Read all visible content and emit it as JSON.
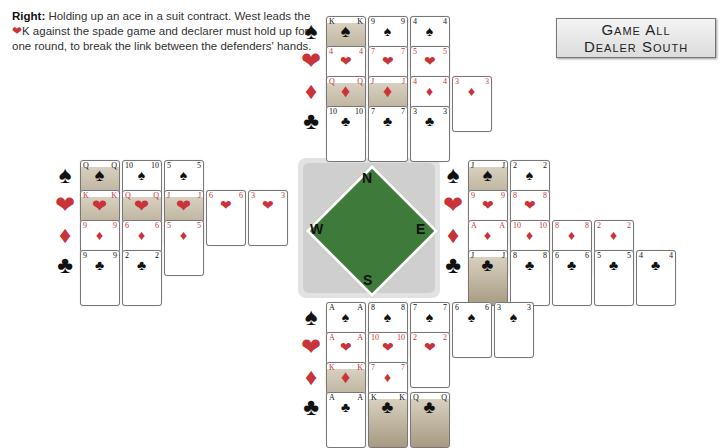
{
  "caption": {
    "lead": "Right:",
    "text_1": " Holding up an ace in a suit contract. West leads the ",
    "heart_symbol": "❤",
    "text_2": "K against the spade game and declarer must hold up for one round, to break the link between the defenders' hands."
  },
  "badge": {
    "line1": "Game All",
    "line2": "Dealer South"
  },
  "compass": {
    "north": "N",
    "south": "S",
    "east": "E",
    "west": "W"
  },
  "suit_symbols": {
    "spades": "♠",
    "hearts": "❤",
    "diamonds": "♦",
    "clubs": "♣"
  },
  "colors": {
    "red_suit": "#c9343a",
    "black_suit": "#111111",
    "table_green": "#3e7b3a"
  },
  "hands": {
    "north": {
      "spades": [
        "K",
        "9",
        "4"
      ],
      "hearts": [
        "4",
        "7",
        "5"
      ],
      "diamonds": [
        "Q",
        "J",
        "4",
        "3"
      ],
      "clubs": [
        "10",
        "7",
        "3"
      ]
    },
    "west": {
      "spades": [
        "Q",
        "10",
        "5"
      ],
      "hearts": [
        "K",
        "Q",
        "J",
        "6",
        "3"
      ],
      "diamonds": [
        "9",
        "6",
        "5"
      ],
      "clubs": [
        "9",
        "2"
      ]
    },
    "east": {
      "spades": [
        "J",
        "2"
      ],
      "hearts": [
        "9",
        "8"
      ],
      "diamonds": [
        "A",
        "10",
        "8",
        "2"
      ],
      "clubs": [
        "J",
        "8",
        "6",
        "5",
        "4"
      ]
    },
    "south": {
      "spades": [
        "A",
        "8",
        "7",
        "6",
        "3"
      ],
      "hearts": [
        "A",
        "10",
        "2"
      ],
      "diamonds": [
        "K",
        "7"
      ],
      "clubs": [
        "A",
        "K",
        "Q"
      ]
    }
  }
}
